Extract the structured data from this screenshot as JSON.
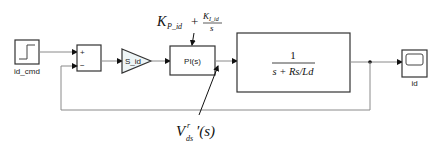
{
  "diagram": {
    "type": "simulink-block-diagram",
    "colors": {
      "line": "#8a8a8a",
      "block_border": "#333333",
      "block_fill": "#ffffff",
      "gain_fill": "#eef5f6"
    },
    "blocks": {
      "step": {
        "label": "id_cmd"
      },
      "sum": {
        "plus_sign": "+",
        "minus_sign": "−"
      },
      "gain": {
        "label": "S_id"
      },
      "pi": {
        "label": "PI(s)"
      },
      "plant": {
        "numerator": "1",
        "denominator": "s + Rs/Ld"
      },
      "scope": {
        "label": "id"
      }
    },
    "annotations": {
      "pi_formula": {
        "kp": "K",
        "kp_sub": "P_id",
        "plus": "+",
        "ki": "K",
        "ki_sub": "I_id",
        "ki_den": "s"
      },
      "voltage": {
        "base": "V",
        "sub": "ds",
        "sup": "r",
        "suffix": "′(s)"
      }
    }
  }
}
